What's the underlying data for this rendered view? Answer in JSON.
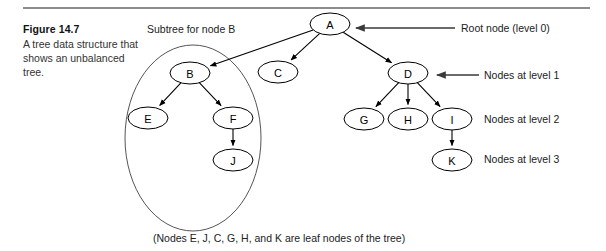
{
  "figure": {
    "number_label": "Figure 14.7",
    "description": "A tree data structure that shows an unbalanced tree.",
    "footnote": "(Nodes E, J, C, G, H, and K are leaf nodes of the tree)"
  },
  "annotations": {
    "subtree_label": "Subtree for node B",
    "root_node": "Root node (level 0)",
    "level_1": "Nodes at level 1",
    "level_2": "Nodes at level 2",
    "level_3": "Nodes at level 3"
  },
  "colors": {
    "rule": "#8c8c8c",
    "node_stroke": "#000000",
    "edge": "#000000",
    "group_outline": "#555555",
    "pointer": "#3a3a3a",
    "text": "#222222"
  },
  "chart_data": {
    "type": "diagram",
    "nodes": [
      {
        "id": "A",
        "label": "A",
        "level": 0,
        "x": 330,
        "y": 24,
        "rx": 20,
        "ry": 11
      },
      {
        "id": "B",
        "label": "B",
        "level": 1,
        "x": 190,
        "y": 73,
        "rx": 20,
        "ry": 11
      },
      {
        "id": "C",
        "label": "C",
        "level": 1,
        "x": 278,
        "y": 72,
        "rx": 20,
        "ry": 11
      },
      {
        "id": "D",
        "label": "D",
        "level": 1,
        "x": 408,
        "y": 73,
        "rx": 20,
        "ry": 11
      },
      {
        "id": "E",
        "label": "E",
        "level": 2,
        "x": 148,
        "y": 118,
        "rx": 20,
        "ry": 11
      },
      {
        "id": "F",
        "label": "F",
        "level": 2,
        "x": 233,
        "y": 118,
        "rx": 20,
        "ry": 11
      },
      {
        "id": "G",
        "label": "G",
        "level": 2,
        "x": 364,
        "y": 119,
        "rx": 20,
        "ry": 11
      },
      {
        "id": "H",
        "label": "H",
        "level": 2,
        "x": 408,
        "y": 119,
        "rx": 20,
        "ry": 11
      },
      {
        "id": "I",
        "label": "I",
        "level": 2,
        "x": 452,
        "y": 119,
        "rx": 20,
        "ry": 11
      },
      {
        "id": "J",
        "label": "J",
        "level": 3,
        "x": 233,
        "y": 160,
        "rx": 20,
        "ry": 11
      },
      {
        "id": "K",
        "label": "K",
        "level": 3,
        "x": 452,
        "y": 160,
        "rx": 20,
        "ry": 11
      }
    ],
    "edges": [
      {
        "from": "A",
        "to": "B"
      },
      {
        "from": "A",
        "to": "C"
      },
      {
        "from": "A",
        "to": "D"
      },
      {
        "from": "B",
        "to": "E"
      },
      {
        "from": "B",
        "to": "F"
      },
      {
        "from": "F",
        "to": "J"
      },
      {
        "from": "D",
        "to": "G"
      },
      {
        "from": "D",
        "to": "H"
      },
      {
        "from": "D",
        "to": "I"
      },
      {
        "from": "I",
        "to": "K"
      }
    ],
    "leaf_nodes": [
      "E",
      "J",
      "C",
      "G",
      "H",
      "K"
    ],
    "group_outline": {
      "label": "Subtree for node B",
      "cx": 193,
      "cy": 138,
      "rx": 68,
      "ry": 93
    },
    "levels": {
      "0": [
        "A"
      ],
      "1": [
        "B",
        "C",
        "D"
      ],
      "2": [
        "E",
        "F",
        "G",
        "H",
        "I"
      ],
      "3": [
        "J",
        "K"
      ]
    }
  }
}
